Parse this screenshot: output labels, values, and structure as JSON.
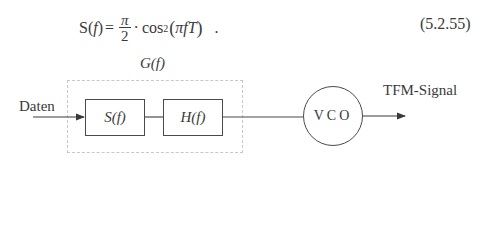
{
  "formula": {
    "lhs": "S(",
    "lhs_var": "f",
    "lhs_close": ")",
    "equals": "=",
    "frac_num": "π",
    "frac_den": "2",
    "rhs_dot": "·",
    "rhs_func": "cos",
    "rhs_exp": "2",
    "rhs_open": "(",
    "rhs_arg": "πfT",
    "rhs_close": ")",
    "trailing": ".",
    "equation_number": "(5.2.55)"
  },
  "diagram": {
    "group_label": "G(f)",
    "input_label": "Daten",
    "blocks": [
      {
        "id": "s",
        "label": "S(f)"
      },
      {
        "id": "h",
        "label": "H(f)"
      }
    ],
    "vco_label": "VCO",
    "output_label": "TFM-Signal"
  },
  "colors": {
    "stroke": "#4a4a4a",
    "dashed": "#c8c8c8",
    "text": "#3a3a3a"
  }
}
